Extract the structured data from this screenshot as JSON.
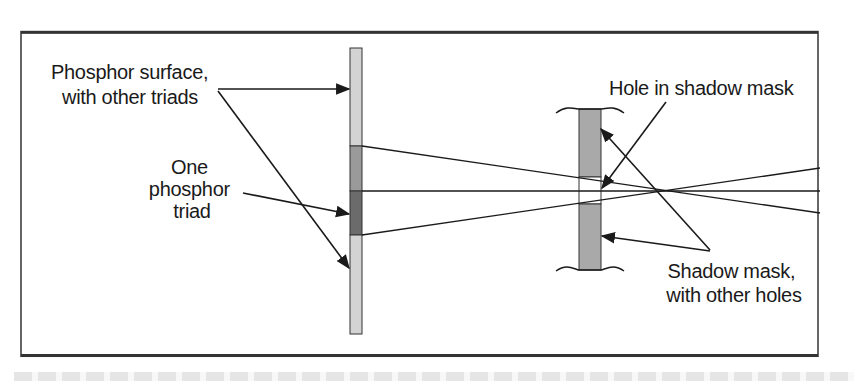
{
  "figure": {
    "frame": {
      "x": 21,
      "y": 16,
      "width": 797,
      "height": 160,
      "stroke": "#333333"
    },
    "labels": {
      "phosphor_surface": [
        "Phosphor surface,",
        "with other triads"
      ],
      "one_triad": [
        "One",
        "phosphor",
        "triad"
      ],
      "hole": [
        "Hole in shadow mask"
      ],
      "shadow_mask": [
        "Shadow mask,",
        "with other holes"
      ]
    },
    "colors": {
      "phosphor_light": "#d3d3d3",
      "phosphor_mid": "#9a9a9a",
      "phosphor_dark": "#6b6b6b",
      "mask_fill": "#a9a9a9",
      "line": "#1a1a1a",
      "frame": "#333333"
    },
    "phosphor_bar": {
      "x": 350,
      "width": 12,
      "top": 48,
      "bottom": 334,
      "mid_top": 146,
      "dark_top": 191,
      "dark_bottom": 235
    },
    "shadow_mask": {
      "x": 579,
      "width": 22,
      "top": 109,
      "bottom": 270,
      "hole_top": 177,
      "hole_bottom": 204
    },
    "beams": {
      "center_y": 191,
      "end_x": 820,
      "upper_start_y": 146,
      "lower_start_y": 235,
      "upper_end_y": 213,
      "lower_end_y": 168
    }
  }
}
